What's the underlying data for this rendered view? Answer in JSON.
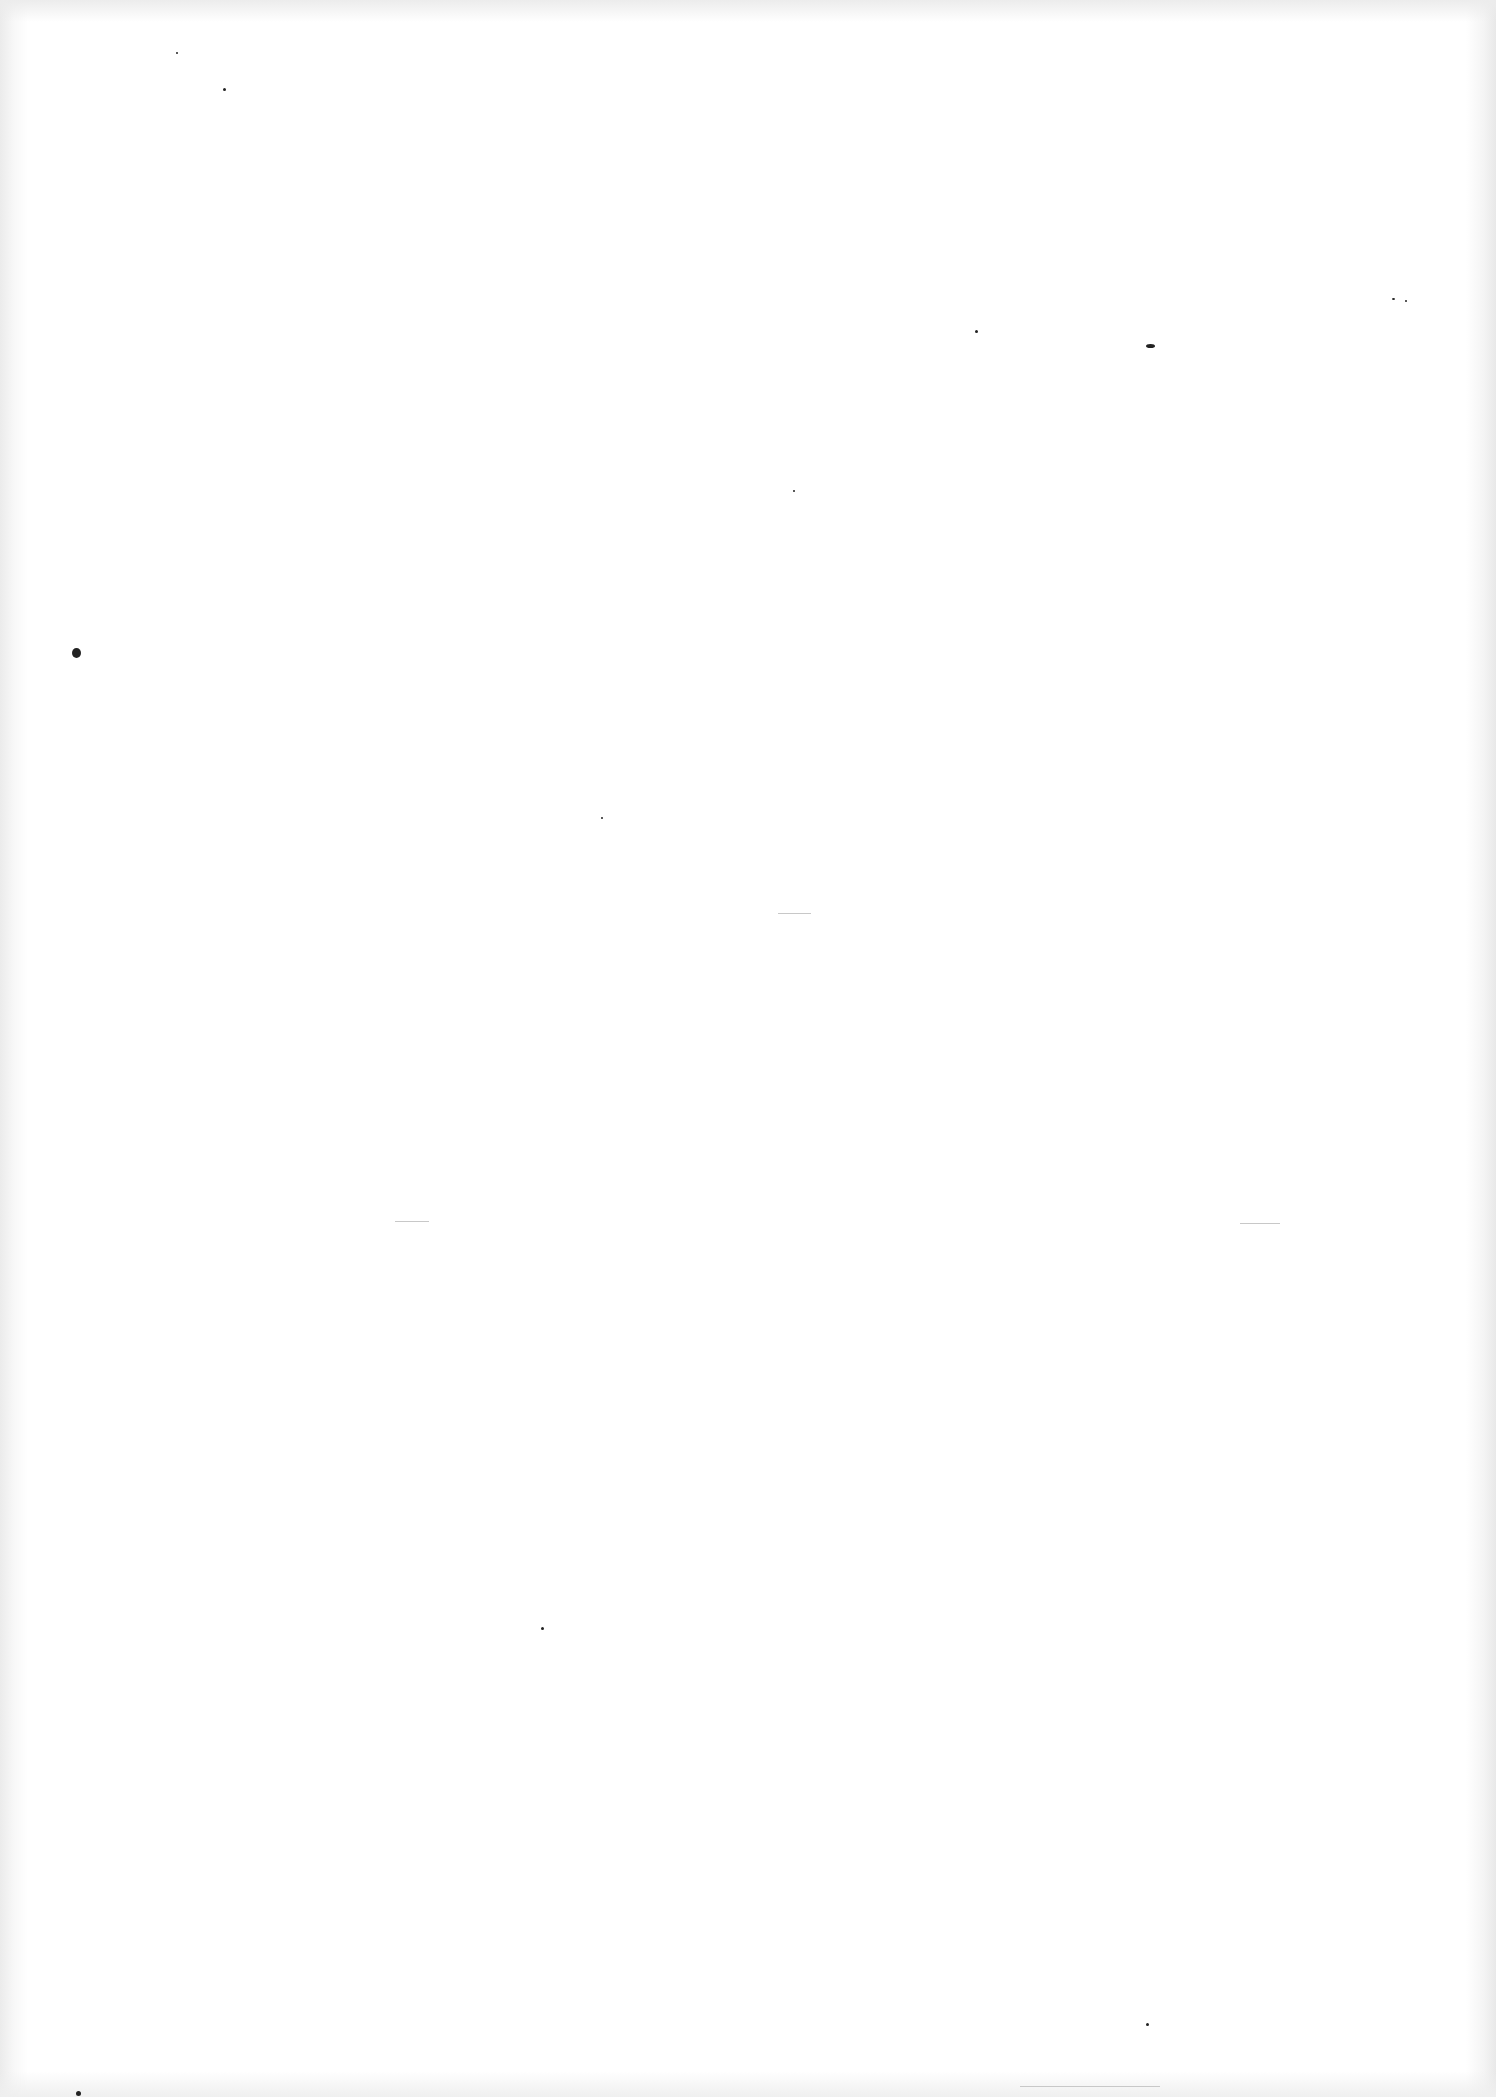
{
  "page": {
    "type": "blank scanned page",
    "background": "#ffffff",
    "text": ""
  },
  "specks": [
    {
      "x": 72,
      "y": 648,
      "w": 9,
      "h": 10
    },
    {
      "x": 1146,
      "y": 344,
      "w": 9,
      "h": 4
    },
    {
      "x": 975,
      "y": 330,
      "w": 3,
      "h": 3
    },
    {
      "x": 793,
      "y": 490,
      "w": 2,
      "h": 2
    },
    {
      "x": 223,
      "y": 88,
      "w": 3,
      "h": 3
    },
    {
      "x": 176,
      "y": 52,
      "w": 2,
      "h": 2
    },
    {
      "x": 601,
      "y": 817,
      "w": 2,
      "h": 2
    },
    {
      "x": 541,
      "y": 1627,
      "w": 3,
      "h": 3
    },
    {
      "x": 1146,
      "y": 2023,
      "w": 3,
      "h": 3
    },
    {
      "x": 76,
      "y": 2091,
      "w": 5,
      "h": 5
    },
    {
      "x": 1392,
      "y": 298,
      "w": 3,
      "h": 2
    },
    {
      "x": 1405,
      "y": 300,
      "w": 2,
      "h": 2
    }
  ],
  "faint_marks": [
    {
      "x": 778,
      "y": 913,
      "w": 33
    },
    {
      "x": 1240,
      "y": 1223,
      "w": 40
    },
    {
      "x": 395,
      "y": 1221,
      "w": 34
    },
    {
      "x": 1020,
      "y": 2086,
      "w": 140
    }
  ]
}
